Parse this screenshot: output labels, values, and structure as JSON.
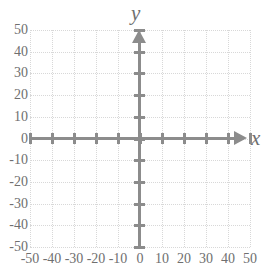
{
  "chart_data": {
    "type": "scatter",
    "title": "",
    "xlabel": "x",
    "ylabel": "y",
    "xlim": [
      -50,
      50
    ],
    "ylim": [
      -50,
      50
    ],
    "x_ticks": [
      -50,
      -40,
      -30,
      -20,
      -10,
      0,
      10,
      20,
      30,
      40,
      50
    ],
    "y_ticks": [
      50,
      40,
      30,
      20,
      10,
      0,
      -10,
      -20,
      -30,
      -40,
      -50
    ],
    "x_tick_labels": [
      "-50",
      "-40",
      "-30",
      "-20",
      "-10",
      "0",
      "10",
      "20",
      "30",
      "40",
      "50"
    ],
    "y_tick_labels": [
      "50",
      "40",
      "30",
      "20",
      "10",
      "0",
      "-10",
      "-20",
      "-30",
      "-40",
      "-50"
    ],
    "grid": true,
    "grid_style": "dotted",
    "legend": null,
    "series": [],
    "values": [],
    "annotations": [],
    "axis_arrows": {
      "x_positive": true,
      "y_positive": true
    }
  },
  "figure": {
    "axis_label_x": "x",
    "axis_label_y": "y",
    "colors": {
      "axis": "#8c8c8c",
      "gridline": "#d8d8d8",
      "tick_label": "#6f6f6f",
      "background": "#ffffff"
    }
  }
}
